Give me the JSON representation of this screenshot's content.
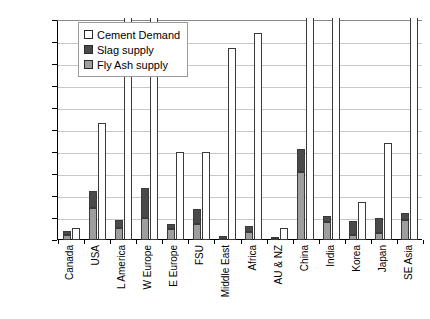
{
  "chart_data": {
    "type": "bar",
    "title": "",
    "xlabel": "",
    "ylabel": "Mt in 2020",
    "ylim": [
      0,
      200
    ],
    "ytick_step": 20,
    "yticks": [
      200,
      180,
      160,
      140,
      120,
      100,
      80,
      60,
      40,
      20,
      0
    ],
    "grid": true,
    "legend_position": "top-left inside plot",
    "stacking": "Slag supply and Fly Ash supply are stacked on one bar; Cement Demand is a separate adjacent bar",
    "note_clipped": "Bars taller than 200 Mt are cut off at the top axis",
    "categories": [
      "Canada",
      "USA",
      "L America",
      "W Europe",
      "E Europe",
      "FSU",
      "Middle East",
      "Africa",
      "AU & NZ",
      "China",
      "India",
      "Korea",
      "Japan",
      "SE Asia"
    ],
    "series": [
      {
        "name": "Cement Demand",
        "color": "#ffffff",
        "values": [
          11,
          106,
          215,
          215,
          80,
          80,
          175,
          188,
          11,
          215,
          215,
          35,
          88,
          215
        ],
        "clipped": [
          false,
          false,
          true,
          true,
          false,
          false,
          false,
          false,
          false,
          true,
          true,
          false,
          false,
          true
        ]
      },
      {
        "name": "Slag supply",
        "color": "#4a4a4a",
        "values": [
          3,
          16,
          7,
          27,
          5,
          13,
          3,
          6,
          2,
          21,
          6,
          12,
          14,
          7
        ]
      },
      {
        "name": "Fly Ash supply",
        "color": "#9e9e9e",
        "values": [
          5,
          29,
          11,
          20,
          10,
          15,
          1,
          7,
          1,
          62,
          16,
          5,
          6,
          18
        ]
      }
    ],
    "stack_totals": [
      8,
      45,
      18,
      47,
      15,
      28,
      4,
      13,
      3,
      83,
      22,
      17,
      20,
      25
    ]
  },
  "legend": {
    "items": [
      {
        "label": "Cement Demand",
        "swatch": "demand"
      },
      {
        "label": "Slag supply",
        "swatch": "slag"
      },
      {
        "label": "Fly Ash supply",
        "swatch": "flyash"
      }
    ]
  }
}
